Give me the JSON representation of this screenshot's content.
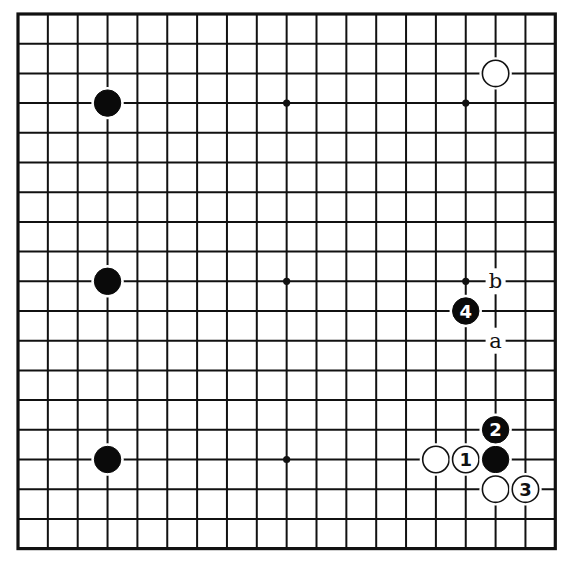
{
  "board": {
    "size": 19,
    "origin_x": 18,
    "origin_y": 14,
    "spacing_x": 29.85,
    "spacing_y": 29.7,
    "line_color": "#111111",
    "background": "#ffffff",
    "star_points": [
      [
        3,
        3
      ],
      [
        9,
        3
      ],
      [
        15,
        3
      ],
      [
        3,
        9
      ],
      [
        9,
        9
      ],
      [
        15,
        9
      ],
      [
        3,
        15
      ],
      [
        9,
        15
      ],
      [
        15,
        15
      ]
    ]
  },
  "stones": [
    {
      "color": "black",
      "col": 3,
      "row": 3,
      "label": ""
    },
    {
      "color": "black",
      "col": 3,
      "row": 9,
      "label": ""
    },
    {
      "color": "black",
      "col": 3,
      "row": 15,
      "label": ""
    },
    {
      "color": "white",
      "col": 16,
      "row": 2,
      "label": ""
    },
    {
      "color": "white",
      "col": 14,
      "row": 15,
      "label": ""
    },
    {
      "color": "white",
      "col": 15,
      "row": 15,
      "label": "1"
    },
    {
      "color": "black",
      "col": 16,
      "row": 15,
      "label": ""
    },
    {
      "color": "black",
      "col": 16,
      "row": 14,
      "label": "2"
    },
    {
      "color": "white",
      "col": 16,
      "row": 16,
      "label": ""
    },
    {
      "color": "white",
      "col": 17,
      "row": 16,
      "label": "3"
    },
    {
      "color": "black",
      "col": 15,
      "row": 10,
      "label": "4"
    }
  ],
  "markers": [
    {
      "text": "b",
      "col": 16,
      "row": 9
    },
    {
      "text": "a",
      "col": 16,
      "row": 11
    }
  ]
}
